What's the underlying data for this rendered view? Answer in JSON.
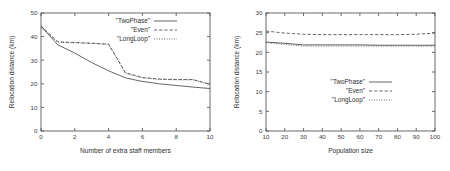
{
  "figure": {
    "panel_count": 2,
    "background_color": "#ffffff",
    "line_color": "#4a4a4a",
    "axis_color": "#5a5a5a"
  },
  "chart_data": [
    {
      "type": "line",
      "panel": "left",
      "title": "",
      "xlabel": "Number of extra staff members",
      "ylabel": "Relocation distance (km)",
      "xlim": [
        0,
        10
      ],
      "ylim": [
        0,
        50
      ],
      "xticks": [
        0,
        2,
        4,
        6,
        8,
        10
      ],
      "yticks": [
        0,
        10,
        20,
        30,
        40,
        50
      ],
      "xticklabels": [
        "0",
        "2",
        "4",
        "6",
        "8",
        "10"
      ],
      "yticklabels": [
        "0",
        "10",
        "20",
        "30",
        "40",
        "50"
      ],
      "grid": false,
      "legend_position": "top-right",
      "x": [
        0,
        1,
        2,
        3,
        4,
        5,
        6,
        7,
        8,
        9,
        10
      ],
      "series": [
        {
          "name": "\"TwoPhase\"",
          "style": "solid",
          "values": [
            44.5,
            36.5,
            33.0,
            29.0,
            25.5,
            22.5,
            21.0,
            20.0,
            19.3,
            18.6,
            18.0
          ]
        },
        {
          "name": "\"Even\"",
          "style": "dashed",
          "values": [
            44.5,
            37.8,
            37.5,
            37.2,
            36.8,
            24.7,
            22.7,
            22.0,
            21.8,
            21.8,
            19.8
          ]
        },
        {
          "name": "\"LongLoop\"",
          "style": "dotted",
          "values": [
            43.8,
            37.6,
            37.4,
            37.1,
            36.7,
            24.4,
            22.5,
            21.9,
            21.7,
            21.7,
            19.6
          ]
        }
      ]
    },
    {
      "type": "line",
      "panel": "right",
      "title": "",
      "xlabel": "Population size",
      "ylabel": "Relocation distance (km)",
      "xlim": [
        10,
        100
      ],
      "ylim": [
        0,
        30
      ],
      "xticks": [
        10,
        20,
        30,
        40,
        50,
        60,
        70,
        80,
        90,
        100
      ],
      "yticks": [
        0,
        5,
        10,
        15,
        20,
        25,
        30
      ],
      "xticklabels": [
        "10",
        "20",
        "30",
        "40",
        "50",
        "60",
        "70",
        "80",
        "90",
        "100"
      ],
      "yticklabels": [
        "0",
        "5",
        "10",
        "15",
        "20",
        "25",
        "30"
      ],
      "grid": false,
      "legend_position": "middle-right",
      "x": [
        10,
        20,
        30,
        40,
        50,
        60,
        70,
        80,
        90,
        100
      ],
      "series": [
        {
          "name": "\"TwoPhase\"",
          "style": "solid",
          "values": [
            22.6,
            22.3,
            21.9,
            21.9,
            21.9,
            21.9,
            21.8,
            21.8,
            21.8,
            21.8
          ]
        },
        {
          "name": "\"Even\"",
          "style": "dashed",
          "values": [
            25.4,
            24.9,
            24.6,
            24.5,
            24.5,
            24.5,
            24.5,
            24.5,
            24.6,
            24.9
          ]
        },
        {
          "name": "\"LongLoop\"",
          "style": "dotted",
          "values": [
            22.5,
            22.0,
            21.6,
            21.6,
            21.6,
            21.6,
            21.6,
            21.6,
            21.6,
            21.6
          ]
        }
      ]
    }
  ]
}
